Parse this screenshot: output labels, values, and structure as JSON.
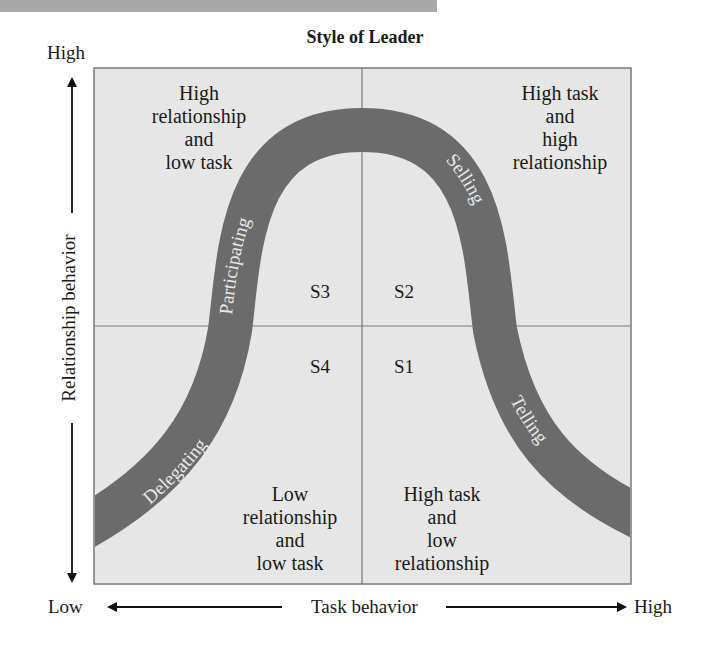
{
  "title": "Style of Leader",
  "y_axis": {
    "label": "Relationship behavior",
    "high": "High",
    "low": "Low"
  },
  "x_axis": {
    "label": "Task behavior",
    "low": "Low",
    "high": "High"
  },
  "quadrants": {
    "top_left": {
      "lines": [
        "High",
        "relationship",
        "and",
        "low task"
      ],
      "code": "S3"
    },
    "top_right": {
      "lines": [
        "High task",
        "and",
        "high",
        "relationship"
      ],
      "code": "S2"
    },
    "bottom_left": {
      "lines": [
        "Low",
        "relationship",
        "and",
        "low task"
      ],
      "code": "S4"
    },
    "bottom_right": {
      "lines": [
        "High task",
        "and",
        "low",
        "relationship"
      ],
      "code": "S1"
    }
  },
  "curve_labels": {
    "delegating": "Delegating",
    "participating": "Participating",
    "selling": "Selling",
    "telling": "Telling"
  },
  "colors": {
    "box_fill": "#e6e6e6",
    "box_border": "#7a7a7a",
    "curve": "#6b6b6b",
    "curve_text": "#e8e8e8",
    "top_bar": "#a9a9a9"
  }
}
